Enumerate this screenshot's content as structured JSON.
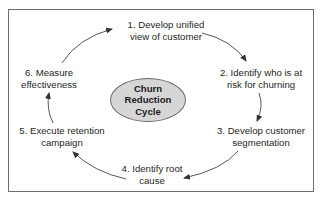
{
  "diagram": {
    "type": "cycle",
    "center": {
      "lines": [
        "Churn",
        "Reduction",
        "Cycle"
      ],
      "fill": "#d6d6d6"
    },
    "steps": [
      {
        "number": 1,
        "lines": [
          "1. Develop unified",
          "view of customer"
        ]
      },
      {
        "number": 2,
        "lines": [
          "2. Identify who is at",
          "risk for churning"
        ]
      },
      {
        "number": 3,
        "lines": [
          "3. Develop customer",
          "segmentation"
        ]
      },
      {
        "number": 4,
        "lines": [
          "4. Identify root",
          "cause"
        ]
      },
      {
        "number": 5,
        "lines": [
          "5. Execute retention",
          "campaign"
        ]
      },
      {
        "number": 6,
        "lines": [
          "6. Measure",
          "effectiveness"
        ]
      }
    ],
    "flow": [
      "1→2",
      "2→3",
      "3→4",
      "4→5",
      "5→6",
      "6→1"
    ],
    "colors": {
      "border": "#6e6e6e",
      "arrow": "#333333",
      "text": "#262626"
    }
  }
}
